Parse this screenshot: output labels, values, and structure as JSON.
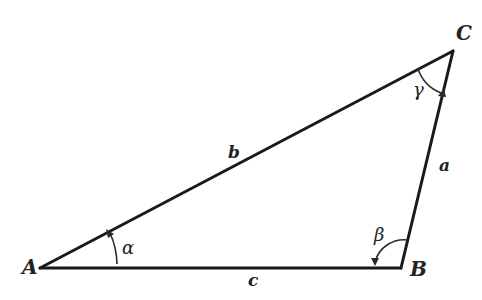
{
  "diagram": {
    "type": "triangle",
    "vertices": {
      "A": {
        "label": "A",
        "x": 40,
        "y": 268
      },
      "B": {
        "label": "B",
        "x": 401,
        "y": 268
      },
      "C": {
        "label": "C",
        "x": 453,
        "y": 51
      }
    },
    "sides": {
      "a": {
        "label": "a",
        "between": "B-C"
      },
      "b": {
        "label": "b",
        "between": "A-C"
      },
      "c": {
        "label": "c",
        "between": "A-B"
      }
    },
    "angles": {
      "alpha": {
        "label": "α",
        "at": "A"
      },
      "beta": {
        "label": "β",
        "at": "B"
      },
      "gamma": {
        "label": "γ",
        "at": "C"
      }
    },
    "colors": {
      "stroke": "#1a1a1a",
      "background": "#ffffff"
    }
  }
}
